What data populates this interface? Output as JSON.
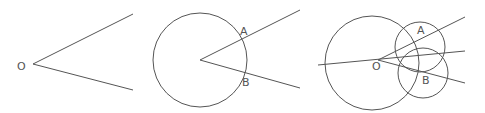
{
  "canvas": {
    "width": 485,
    "height": 113,
    "background": "#ffffff",
    "stroke_color": "#555555"
  },
  "panels": [
    {
      "id": "angle",
      "labels": {
        "vertex": "O"
      },
      "vertex": [
        33,
        64
      ],
      "rays": [
        [
          133,
          14
        ],
        [
          133,
          90
        ]
      ],
      "label_pos": {
        "O": [
          17,
          70
        ]
      }
    },
    {
      "id": "arc-on-angle",
      "labels": {
        "a": "A",
        "b": "B"
      },
      "vertex": [
        200,
        60
      ],
      "circle": {
        "cx": 200,
        "cy": 60,
        "r": 47
      },
      "rays": [
        [
          300,
          10
        ],
        [
          300,
          88
        ]
      ],
      "label_pos": {
        "A": [
          240,
          35
        ],
        "B": [
          242,
          86
        ]
      }
    },
    {
      "id": "bisector-construction",
      "labels": {
        "vertex": "O",
        "a": "A",
        "b": "B"
      },
      "vertex": [
        378,
        60
      ],
      "circle": {
        "cx": 372,
        "cy": 63,
        "r": 47
      },
      "rays": [
        [
          465,
          17
        ],
        [
          465,
          83
        ]
      ],
      "bisector": [
        [
          318,
          65
        ],
        [
          465,
          51
        ]
      ],
      "arcs": [
        {
          "name": "A",
          "cx": 420,
          "cy": 47,
          "r": 25
        },
        {
          "name": "B",
          "cx": 423,
          "cy": 73,
          "r": 25
        }
      ],
      "label_pos": {
        "O": [
          372,
          70
        ],
        "A": [
          417,
          34
        ],
        "B": [
          422,
          84
        ]
      }
    }
  ]
}
